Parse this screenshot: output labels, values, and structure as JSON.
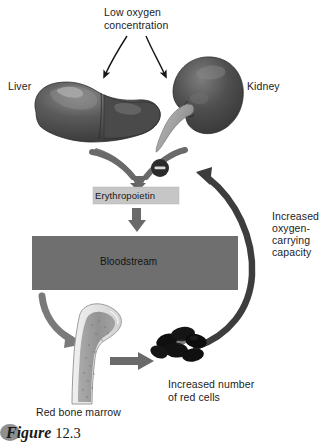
{
  "figure": {
    "caption_word": "Figure",
    "caption_number": "12.3",
    "bullet_icon": "oval-bullet-icon"
  },
  "labels": {
    "low_oxygen": "Low oxygen\nconcentration",
    "liver": "Liver",
    "kidney": "Kidney",
    "erythropoietin": "Erythropoietin",
    "bloodstream": "Bloodstream",
    "increased_capacity": "Increased\noxygen-\ncarrying\ncapacity",
    "red_bone_marrow": "Red bone marrow",
    "increased_red_cells": "Increased number\nof red cells"
  },
  "organs": [
    {
      "name": "liver-organ",
      "label": "Liver"
    },
    {
      "name": "kidney-organ",
      "label": "Kidney"
    },
    {
      "name": "bone-marrow-organ",
      "label": "Red bone marrow"
    },
    {
      "name": "red-blood-cells-cluster",
      "label": "Increased number of red cells"
    }
  ],
  "arrows": [
    {
      "name": "arrow-low-oxygen-to-liver",
      "style": "thin-black-curved"
    },
    {
      "name": "arrow-low-oxygen-to-kidney",
      "style": "thin-black-curved"
    },
    {
      "name": "arrow-liver-to-erythropoietin",
      "style": "thick-gray-curved"
    },
    {
      "name": "arrow-kidney-to-erythropoietin",
      "style": "thick-gray-curved"
    },
    {
      "name": "arrow-erythropoietin-to-bloodstream",
      "style": "thick-gray-straight"
    },
    {
      "name": "arrow-bloodstream-to-bone-marrow",
      "style": "thick-gray-curved"
    },
    {
      "name": "arrow-bone-marrow-to-red-cells",
      "style": "thick-gray-straight"
    },
    {
      "name": "arrow-feedback-negative",
      "style": "thick-dark-arc"
    }
  ],
  "feedback": {
    "symbol": "−",
    "name": "negative-feedback-marker"
  },
  "colors": {
    "background": "#ffffff",
    "organ_dark": "#4a4a4a",
    "organ_highlight": "#8e8e8e",
    "bloodstream_box": "#6f6f6f",
    "erythropoietin_box": "#c4c4c4",
    "arrow_gray": "#6e6e6e",
    "arrow_dark": "#3a3a3a",
    "text": "#1a1a1a",
    "bone_cortex": "#e8e8e8",
    "bone_marrow": "#9a9a9a",
    "red_cell": "#111111"
  }
}
